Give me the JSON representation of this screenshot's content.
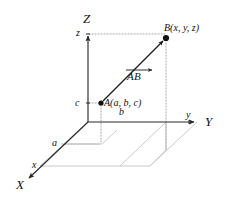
{
  "figure": {
    "type": "3d-cartesian-coordinate-diagram",
    "background_color": "#ffffff",
    "stroke_color": "#2a2a2a",
    "light_stroke_color": "#b9b9b9",
    "dotted_color": "#9a9a9a",
    "axes": [
      {
        "name": "z-axis",
        "label": "Z",
        "direction": "up"
      },
      {
        "name": "y-axis",
        "label": "Y",
        "direction": "right"
      },
      {
        "name": "x-axis",
        "label": "X",
        "direction": "down-left"
      }
    ],
    "axis_labels": {
      "x": "X",
      "y": "Y",
      "z": "Z"
    },
    "tick_labels": {
      "z_upper": "z",
      "z_lower": "c",
      "y_near": "b",
      "y_far": "y",
      "x_near": "a",
      "x_far": "x"
    },
    "points": [
      {
        "name": "point-a",
        "label": "A(a,  b,  c)",
        "coords": [
          101,
          103
        ]
      },
      {
        "name": "point-b",
        "label": "B(x,  y,  z)",
        "coords": [
          166,
          38
        ]
      }
    ],
    "vector": {
      "name": "vector-ab",
      "label": "AB",
      "notation": "overline-arrow",
      "from": "A",
      "to": "B"
    },
    "origin": [
      88,
      122
    ]
  }
}
